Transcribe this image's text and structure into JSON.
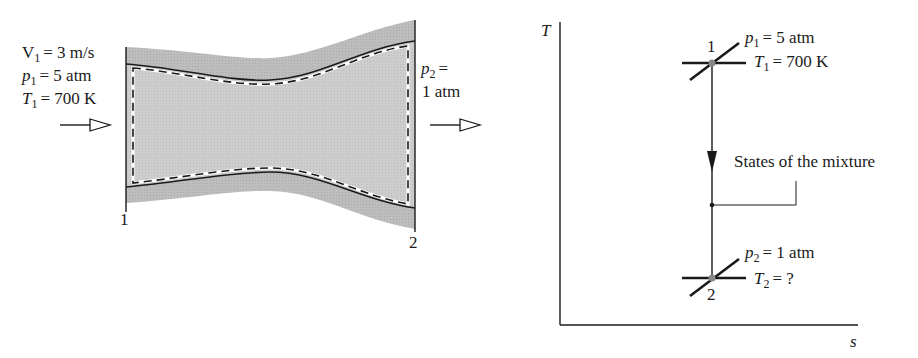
{
  "nozzle": {
    "inlet": {
      "velocity": {
        "symbol": "V",
        "subscript": "1",
        "value": "= 3 m/s"
      },
      "pressure": {
        "symbol": "p",
        "subscript": "1",
        "value": "= 5 atm"
      },
      "temperature": {
        "symbol": "T",
        "subscript": "1",
        "value": "= 700 K"
      }
    },
    "outlet": {
      "pressure": {
        "symbol": "p",
        "subscript": "2",
        "value_line1": "=",
        "value_line2": "1 atm"
      }
    },
    "station_labels": [
      "1",
      "2"
    ],
    "colors": {
      "wall_fill": "#b5b5b5",
      "gas_fill": "#c8c8c8",
      "line": "#1a1a1a"
    }
  },
  "ts_diagram": {
    "y_axis_label": "T",
    "x_axis_label": "s",
    "state1": {
      "label": "1",
      "pressure": {
        "symbol": "p",
        "subscript": "1",
        "value": "= 5 atm"
      },
      "temperature": {
        "symbol": "T",
        "subscript": "1",
        "value": "= 700 K"
      }
    },
    "state2": {
      "label": "2",
      "pressure": {
        "symbol": "p",
        "subscript": "2",
        "value": "= 1 atm"
      },
      "temperature": {
        "symbol": "T",
        "subscript": "2",
        "value": "= ?"
      }
    },
    "annotation": "States of the mixture"
  }
}
